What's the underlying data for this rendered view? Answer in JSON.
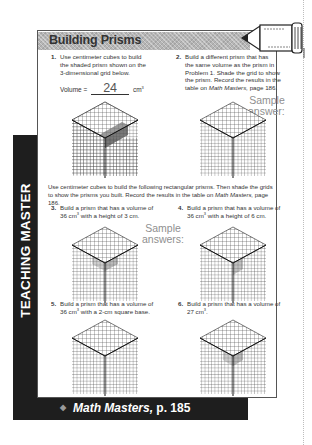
{
  "page": {
    "side_label": "TEACHING MASTER",
    "header": {
      "title": "Building Prisms",
      "icon": "pencil-icon"
    },
    "problems": [
      {
        "number": "1.",
        "text_lines": [
          "Use centimeter cubes to build",
          "the shaded prism shown on the",
          "3-dimensional grid below."
        ],
        "volume_label": "Volume =",
        "volume_answer": "24",
        "volume_unit": "cm",
        "volume_unit_exp": "3"
      },
      {
        "number": "2.",
        "text_lines": [
          "Build a different prism that has",
          "the same volume as the prism in",
          "Problem 1. Shade the grid to show",
          "the prism. Record the results in the"
        ],
        "last_line_prefix": "table on ",
        "last_line_italic": "Math Masters,",
        "last_line_suffix": " page 186."
      },
      {
        "number": "3.",
        "line1": "Build a prism that has a volume of",
        "line2_prefix": "36 cm",
        "line2_exp": "3",
        "line2_suffix": " with a height of 3 cm."
      },
      {
        "number": "4.",
        "line1": "Build a prism that has a volume of",
        "line2_prefix": "36 cm",
        "line2_exp": "3",
        "line2_suffix": " with a height of 6 cm."
      },
      {
        "number": "5.",
        "line1": "Build a prism that has a volume of",
        "line2_prefix": "36 cm",
        "line2_exp": "3",
        "line2_suffix": " with a 2-cm square base."
      },
      {
        "number": "6.",
        "line1": "Build a prism that has a volume of",
        "line2_prefix": "27 cm",
        "line2_exp": "3",
        "line2_suffix": "."
      }
    ],
    "sample_answer": {
      "line1": "Sample",
      "line2": "answer:"
    },
    "sample_answers": {
      "line1": "Sample",
      "line2": "answers:"
    },
    "instructions": {
      "line1": "Use centimeter cubes to build the following rectangular prisms. Then shade the grids",
      "line2_prefix": "to show the prisms you built. Record the results in the table on ",
      "line2_italic": "Math Masters,",
      "line2_suffix": " page 186."
    },
    "footer": {
      "bullet": "◆",
      "title_italic": "Math Masters,",
      "page": " p. 185"
    },
    "colors": {
      "band": "#1e1e1e",
      "header": "#b5b5b5",
      "grid": "#444444",
      "shade": "#7a7a7a",
      "sample_text": "#8f8f8f"
    }
  }
}
